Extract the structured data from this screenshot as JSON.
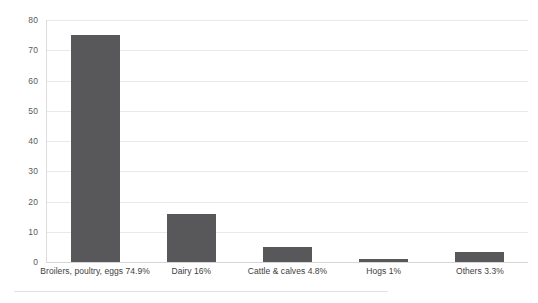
{
  "chart_data": {
    "type": "bar",
    "title": "",
    "subtitle": "",
    "xlabel": "",
    "ylabel": "",
    "categories": [
      "Broilers, poultry, eggs 74.9%",
      "Dairy 16%",
      "Cattle & calves 4.8%",
      "Hogs 1%",
      "Others 3.3%"
    ],
    "values": [
      74.9,
      16,
      4.8,
      1,
      3.3
    ],
    "ylim": [
      0,
      80
    ],
    "ytick_labels": [
      "80",
      "70",
      "60",
      "50",
      "40",
      "30",
      "20",
      "10",
      "0"
    ],
    "ytick_values": [
      80,
      70,
      60,
      50,
      40,
      30,
      20,
      10,
      0
    ],
    "grid": "horizontal",
    "legend": "none",
    "bar_color": "#58585a",
    "gridline_color": "#e9e9e9",
    "background_color": "#ffffff",
    "axis_text_color": "#5a5a5a",
    "category_text_color": "#3d3d3d"
  }
}
